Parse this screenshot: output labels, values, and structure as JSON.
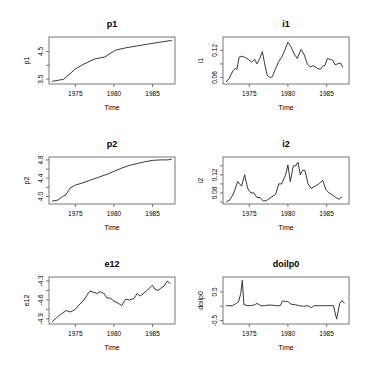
{
  "chart_data": [
    {
      "type": "line",
      "title": "p1",
      "xlabel": "Time",
      "ylabel": "p1",
      "xticks": [
        1975,
        1980,
        1985
      ],
      "yticks": [
        3.5,
        4.5
      ],
      "ytick_labels": [
        "3.5",
        "4.5"
      ],
      "ylim": [
        3.4,
        4.95
      ],
      "x": [
        1972.0,
        1973.5,
        1975.0,
        1976.0,
        1977.5,
        1978.8,
        1980.2,
        1981.5,
        1983.0,
        1984.5,
        1986.0,
        1987.5
      ],
      "values": [
        3.42,
        3.5,
        3.87,
        4.03,
        4.23,
        4.3,
        4.55,
        4.63,
        4.7,
        4.77,
        4.84,
        4.9
      ]
    },
    {
      "type": "line",
      "title": "i1",
      "xlabel": "Time",
      "ylabel": "i1",
      "xticks": [
        1975,
        1980,
        1985
      ],
      "yticks": [
        0.06,
        0.12
      ],
      "ytick_labels": [
        "0.06",
        "0.12"
      ],
      "ylim": [
        0.05,
        0.145
      ],
      "x": [
        1972.0,
        1972.4,
        1972.9,
        1973.2,
        1973.4,
        1973.7,
        1974.1,
        1974.5,
        1974.9,
        1975.3,
        1975.7,
        1976.0,
        1976.3,
        1976.7,
        1977.0,
        1977.3,
        1977.7,
        1978.0,
        1978.4,
        1978.8,
        1979.2,
        1979.6,
        1980.0,
        1980.4,
        1980.8,
        1981.2,
        1981.7,
        1982.1,
        1982.5,
        1982.9,
        1983.3,
        1983.8,
        1984.2,
        1984.5,
        1984.8,
        1985.1,
        1985.5,
        1985.8,
        1986.1,
        1986.4,
        1986.8,
        1987.1
      ],
      "values": [
        0.05,
        0.058,
        0.075,
        0.08,
        0.078,
        0.105,
        0.107,
        0.104,
        0.1,
        0.094,
        0.1,
        0.09,
        0.1,
        0.117,
        0.09,
        0.065,
        0.06,
        0.062,
        0.08,
        0.095,
        0.105,
        0.12,
        0.138,
        0.128,
        0.112,
        0.102,
        0.122,
        0.11,
        0.09,
        0.083,
        0.086,
        0.08,
        0.078,
        0.085,
        0.087,
        0.102,
        0.1,
        0.098,
        0.088,
        0.09,
        0.092,
        0.082
      ]
    },
    {
      "type": "line",
      "title": "p2",
      "xlabel": "Time",
      "ylabel": "p2",
      "xticks": [
        1975,
        1980,
        1985
      ],
      "yticks": [
        4.0,
        4.4,
        4.8
      ],
      "ytick_labels": [
        "4.0",
        "4.4",
        "4.8"
      ],
      "ylim": [
        3.88,
        4.82
      ],
      "x": [
        1972.0,
        1972.7,
        1973.2,
        1973.8,
        1974.3,
        1975.0,
        1976.0,
        1977.0,
        1978.0,
        1979.0,
        1980.0,
        1981.0,
        1982.0,
        1983.0,
        1984.0,
        1985.0,
        1986.0,
        1987.0,
        1987.5
      ],
      "values": [
        3.9,
        3.92,
        3.98,
        4.04,
        4.18,
        4.25,
        4.3,
        4.36,
        4.42,
        4.48,
        4.55,
        4.62,
        4.68,
        4.72,
        4.76,
        4.79,
        4.8,
        4.8,
        4.82
      ]
    },
    {
      "type": "line",
      "title": "i2",
      "xlabel": "Time",
      "ylabel": "i2",
      "xticks": [
        1975,
        1980,
        1985
      ],
      "yticks": [
        0.08,
        0.12
      ],
      "ytick_labels": [
        "0.08",
        "0.12"
      ],
      "ylim": [
        0.06,
        0.155
      ],
      "x": [
        1972.0,
        1972.5,
        1973.0,
        1973.5,
        1974.0,
        1974.4,
        1974.8,
        1975.2,
        1975.6,
        1976.0,
        1976.4,
        1976.8,
        1977.2,
        1977.8,
        1978.4,
        1978.8,
        1979.2,
        1979.7,
        1980.0,
        1980.3,
        1980.7,
        1981.0,
        1981.3,
        1981.6,
        1981.9,
        1982.2,
        1982.6,
        1983.0,
        1983.5,
        1984.0,
        1984.5,
        1984.9,
        1985.3,
        1985.8,
        1986.2,
        1986.6,
        1987.0
      ],
      "values": [
        0.06,
        0.065,
        0.08,
        0.105,
        0.095,
        0.12,
        0.09,
        0.08,
        0.08,
        0.07,
        0.07,
        0.062,
        0.063,
        0.07,
        0.077,
        0.1,
        0.1,
        0.12,
        0.142,
        0.105,
        0.14,
        0.14,
        0.148,
        0.12,
        0.13,
        0.13,
        0.1,
        0.09,
        0.095,
        0.1,
        0.108,
        0.088,
        0.08,
        0.075,
        0.07,
        0.066,
        0.072
      ]
    },
    {
      "type": "line",
      "title": "e12",
      "xlabel": "Time",
      "ylabel": "e12",
      "xticks": [
        1975,
        1980,
        1985
      ],
      "yticks": [
        -4.9,
        -4.6,
        -4.3
      ],
      "ytick_labels": [
        "-4.9",
        "-4.6",
        "-4.3"
      ],
      "ylim": [
        -4.95,
        -4.27
      ],
      "x": [
        1972.0,
        1972.6,
        1973.2,
        1973.8,
        1974.4,
        1975.0,
        1975.5,
        1976.0,
        1976.5,
        1976.9,
        1977.4,
        1977.9,
        1978.2,
        1978.7,
        1979.1,
        1979.5,
        1980.0,
        1980.5,
        1981.0,
        1981.5,
        1982.0,
        1982.6,
        1983.0,
        1983.4,
        1983.9,
        1984.3,
        1984.7,
        1985.0,
        1985.3,
        1985.7,
        1986.1,
        1986.5,
        1986.9,
        1987.3
      ],
      "values": [
        -4.95,
        -4.88,
        -4.82,
        -4.77,
        -4.79,
        -4.75,
        -4.68,
        -4.62,
        -4.53,
        -4.46,
        -4.48,
        -4.5,
        -4.47,
        -4.5,
        -4.57,
        -4.57,
        -4.62,
        -4.65,
        -4.69,
        -4.59,
        -4.6,
        -4.58,
        -4.5,
        -4.54,
        -4.49,
        -4.45,
        -4.4,
        -4.37,
        -4.43,
        -4.45,
        -4.41,
        -4.38,
        -4.3,
        -4.35
      ]
    },
    {
      "type": "line",
      "title": "doilp0",
      "xlabel": "Time",
      "ylabel": "doilp0",
      "xticks": [
        1975,
        1980,
        1985
      ],
      "yticks": [
        -0.5,
        0.5
      ],
      "ytick_labels": [
        "-0.5",
        "0.5"
      ],
      "ylim": [
        -0.55,
        0.95
      ],
      "x": [
        1972.0,
        1972.8,
        1973.2,
        1973.6,
        1973.9,
        1974.1,
        1974.3,
        1974.7,
        1975.2,
        1975.7,
        1976.0,
        1976.5,
        1977.0,
        1977.4,
        1977.9,
        1978.5,
        1979.0,
        1979.3,
        1980.0,
        1980.4,
        1981.0,
        1981.5,
        1982.0,
        1982.6,
        1983.0,
        1983.4,
        1984.0,
        1984.5,
        1985.0,
        1985.5,
        1985.9,
        1986.3,
        1986.7,
        1987.0,
        1987.3
      ],
      "values": [
        0.02,
        0.02,
        0.08,
        0.15,
        0.45,
        0.9,
        0.05,
        0.03,
        0.02,
        0.05,
        0.1,
        0.02,
        0.02,
        0.04,
        0.04,
        0.02,
        0.02,
        0.18,
        0.16,
        0.07,
        0.05,
        0.02,
        0.0,
        0.02,
        -0.05,
        0.02,
        0.02,
        0.02,
        0.02,
        0.02,
        0.02,
        -0.45,
        0.1,
        0.2,
        0.1
      ]
    }
  ]
}
